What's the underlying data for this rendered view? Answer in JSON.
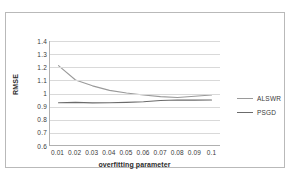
{
  "chart_data": {
    "type": "line",
    "title": "",
    "xlabel": "overfitting parameter",
    "ylabel": "RMSE",
    "x": [
      0.01,
      0.02,
      0.03,
      0.04,
      0.05,
      0.06,
      0.07,
      0.08,
      0.09,
      0.1
    ],
    "xtick_labels": [
      "0.01",
      "0.02",
      "0.03",
      "0.04",
      "0.05",
      "0.06",
      "0.07",
      "0.08",
      "0.09",
      "0.1"
    ],
    "ytick_labels": [
      "1.4",
      "1.3",
      "1.2",
      "1.1",
      "1",
      "0.9",
      "0.8",
      "0.7",
      "0.6"
    ],
    "ytick_values": [
      1.4,
      1.3,
      1.2,
      1.1,
      1.0,
      0.9,
      0.8,
      0.7,
      0.6
    ],
    "ylim": [
      0.6,
      1.4
    ],
    "grid": "horizontal",
    "legend_position": "right",
    "series": [
      {
        "name": "ALSWR",
        "color": "#9a9a9a",
        "values": [
          1.21,
          1.1,
          1.055,
          1.02,
          1.0,
          0.985,
          0.972,
          0.965,
          0.975,
          0.985
        ]
      },
      {
        "name": "PSGD",
        "color": "#6b6b6b",
        "values": [
          0.925,
          0.928,
          0.924,
          0.925,
          0.928,
          0.933,
          0.942,
          0.946,
          0.945,
          0.946
        ]
      }
    ]
  }
}
